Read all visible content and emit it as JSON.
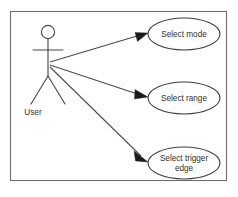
{
  "diagram": {
    "kind": "uml-use-case-diagram",
    "canvas": {
      "width": 238,
      "height": 197,
      "background": "#ffffff"
    },
    "frame": {
      "x": 10.5,
      "y": 11.5,
      "width": 216,
      "height": 169,
      "stroke": "#6f6f6f",
      "fill": "#ffffff"
    },
    "actor": {
      "name": "User",
      "label": "User",
      "label_x": 33,
      "label_y": 113,
      "head_cx": 48,
      "head_cy": 32,
      "head_r": 6.6,
      "body_top_y": 38.6,
      "body_bottom_y": 76,
      "arms_y": 50,
      "arm_left_x": 33,
      "arm_right_x": 63,
      "leg_left_x": 31,
      "leg_right_x": 65,
      "leg_bottom_y": 104,
      "stroke": "#4a4a4a"
    },
    "connection_origin": {
      "x": 50,
      "y": 63
    },
    "usecases": [
      {
        "id": "select-mode",
        "label": "Select mode",
        "lines": [
          "Select mode"
        ],
        "cx": 184,
        "cy": 34,
        "rx": 36,
        "ry": 16,
        "stroke": "#3d3d3d",
        "fill": "#ffffff"
      },
      {
        "id": "select-range",
        "label": "Select range",
        "lines": [
          "Select range"
        ],
        "cx": 184,
        "cy": 98,
        "rx": 36,
        "ry": 16,
        "stroke": "#3d3d3d",
        "fill": "#ffffff"
      },
      {
        "id": "select-trigger-edge",
        "label": "Select trigger edge",
        "lines": [
          "Select trigger",
          "edge"
        ],
        "cx": 184,
        "cy": 163,
        "rx": 36,
        "ry": 16,
        "stroke": "#3d3d3d",
        "fill": "#ffffff"
      }
    ],
    "associations": [
      {
        "id": "assoc-user-select-mode",
        "from": "User",
        "to": "Select mode",
        "x1": 50,
        "y1": 62,
        "x2": 148,
        "y2": 33,
        "arrow": "filled-triangle",
        "arrow_color": "#1b1b1b"
      },
      {
        "id": "assoc-user-select-range",
        "from": "User",
        "to": "Select range",
        "x1": 50,
        "y1": 65,
        "x2": 148,
        "y2": 97,
        "arrow": "filled-triangle",
        "arrow_color": "#1b1b1b"
      },
      {
        "id": "assoc-user-select-trigger-edge",
        "from": "User",
        "to": "Select trigger edge",
        "x1": 50,
        "y1": 67,
        "x2": 148,
        "y2": 160,
        "arrow": "filled-triangle",
        "arrow_color": "#1b1b1b"
      }
    ]
  }
}
